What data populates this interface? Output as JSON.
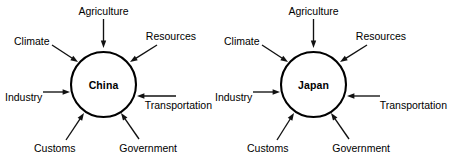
{
  "document": {
    "kind": "radial-influence-diagram",
    "background_color": "#ffffff",
    "stroke_color": "#111111",
    "text_color": "#000000"
  },
  "diagrams": [
    {
      "id": "china-diagram",
      "hub": {
        "label": "China",
        "cx": 103.5,
        "cy": 84.5,
        "r": 32.5
      },
      "factors": [
        {
          "key": "agriculture",
          "label": "Agriculture",
          "position": "top",
          "label_x": 103.5,
          "label_y": 11,
          "label_align": "center",
          "line": {
            "x1": 103.5,
            "y1": 19,
            "x2": 103.5,
            "y2": 48
          },
          "arrow_angle": 90
        },
        {
          "key": "climate",
          "label": "Climate",
          "position": "upper-left",
          "label_x": 14,
          "label_y": 41,
          "label_align": "left",
          "line": {
            "x1": 52,
            "y1": 45,
            "x2": 78,
            "y2": 62
          },
          "arrow_angle": 33
        },
        {
          "key": "resources",
          "label": "Resources",
          "position": "upper-right",
          "label_x": 196,
          "label_y": 36,
          "label_align": "right",
          "line": {
            "x1": 157,
            "y1": 45,
            "x2": 130,
            "y2": 62
          },
          "arrow_angle": 147
        },
        {
          "key": "industry",
          "label": "Industry",
          "position": "left",
          "label_x": 5,
          "label_y": 97,
          "label_align": "left",
          "line": {
            "x1": 43,
            "y1": 92,
            "x2": 70,
            "y2": 92
          },
          "arrow_angle": 0
        },
        {
          "key": "transportation",
          "label": "Transportation",
          "position": "right",
          "label_x": 212,
          "label_y": 105,
          "label_align": "right",
          "line": {
            "x1": 176,
            "y1": 96,
            "x2": 137,
            "y2": 96
          },
          "arrow_angle": 180
        },
        {
          "key": "customs",
          "label": "Customs",
          "position": "lower-left",
          "label_x": 34,
          "label_y": 148,
          "label_align": "left",
          "line": {
            "x1": 66,
            "y1": 140,
            "x2": 84,
            "y2": 113
          },
          "arrow_angle": -56
        },
        {
          "key": "government",
          "label": "Government",
          "position": "lower-right",
          "label_x": 177,
          "label_y": 148,
          "label_align": "right",
          "line": {
            "x1": 139,
            "y1": 139,
            "x2": 121,
            "y2": 113
          },
          "arrow_angle": -124
        }
      ]
    },
    {
      "id": "japan-diagram",
      "hub": {
        "label": "Japan",
        "cx": 313.5,
        "cy": 84.5,
        "r": 32.5
      },
      "factors": [
        {
          "key": "agriculture",
          "label": "Agriculture",
          "position": "top",
          "label_x": 313.5,
          "label_y": 11,
          "label_align": "center",
          "line": {
            "x1": 313.5,
            "y1": 19,
            "x2": 313.5,
            "y2": 48
          },
          "arrow_angle": 90
        },
        {
          "key": "climate",
          "label": "Climate",
          "position": "upper-left",
          "label_x": 224,
          "label_y": 41,
          "label_align": "left",
          "line": {
            "x1": 262,
            "y1": 45,
            "x2": 288,
            "y2": 62
          },
          "arrow_angle": 33
        },
        {
          "key": "resources",
          "label": "Resources",
          "position": "upper-right",
          "label_x": 406,
          "label_y": 36,
          "label_align": "right",
          "line": {
            "x1": 367,
            "y1": 45,
            "x2": 340,
            "y2": 62
          },
          "arrow_angle": 147
        },
        {
          "key": "industry",
          "label": "Industry",
          "position": "left",
          "label_x": 215,
          "label_y": 97,
          "label_align": "left",
          "line": {
            "x1": 253,
            "y1": 92,
            "x2": 280,
            "y2": 92
          },
          "arrow_angle": 0
        },
        {
          "key": "transportation",
          "label": "Transportation",
          "position": "right",
          "label_x": 447,
          "label_y": 105,
          "label_align": "right",
          "line": {
            "x1": 380,
            "y1": 96,
            "x2": 347,
            "y2": 96
          },
          "arrow_angle": 180
        },
        {
          "key": "customs",
          "label": "Customs",
          "position": "lower-left",
          "label_x": 247,
          "label_y": 148,
          "label_align": "left",
          "line": {
            "x1": 277,
            "y1": 140,
            "x2": 294,
            "y2": 113
          },
          "arrow_angle": -56
        },
        {
          "key": "government",
          "label": "Government",
          "position": "lower-right",
          "label_x": 390,
          "label_y": 148,
          "label_align": "right",
          "line": {
            "x1": 349,
            "y1": 139,
            "x2": 331,
            "y2": 113
          },
          "arrow_angle": -124
        }
      ]
    }
  ]
}
